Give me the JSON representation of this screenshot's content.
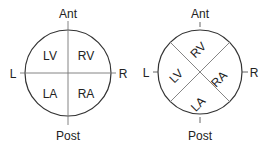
{
  "diagrams": [
    {
      "labels": {
        "top": "Ant",
        "bottom": "Post",
        "left": "L",
        "right": "R"
      },
      "quadrants": {
        "tl": "LV",
        "tr": "RV",
        "bl": "LA",
        "br": "RA"
      }
    },
    {
      "labels": {
        "top": "Ant",
        "bottom": "Post",
        "left": "L",
        "right": "R"
      },
      "quadrants": {
        "top": "RV",
        "left": "LV",
        "right": "RA",
        "bottom": "LA"
      }
    }
  ],
  "colors": {
    "stroke": "#333333",
    "divider": "#777777"
  }
}
